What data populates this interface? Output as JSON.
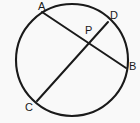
{
  "figure": {
    "background_color": "#f9f9f9",
    "stroke_color": "#1a1a1a",
    "label_color": "#1a1a1a",
    "circle": {
      "name": "circle-outline",
      "center_x": 72,
      "center_y": 60,
      "radius": 56,
      "stroke_width": 2.1,
      "fill": "none"
    },
    "chords": [
      {
        "name": "chord-ab",
        "from": "A",
        "to": "B",
        "x1": 42,
        "y1": 12,
        "x2": 126,
        "y2": 68,
        "stroke_width": 2.0
      },
      {
        "name": "chord-cd",
        "from": "C",
        "to": "D",
        "x1": 37,
        "y1": 101,
        "x2": 108,
        "y2": 22,
        "stroke_width": 2.0
      }
    ],
    "points": [
      {
        "id": "A",
        "label": "A",
        "x": 42,
        "y": 12,
        "label_x": 38,
        "label_y": 1
      },
      {
        "id": "D",
        "label": "D",
        "x": 108,
        "y": 22,
        "label_x": 110,
        "label_y": 10
      },
      {
        "id": "P",
        "label": "P",
        "x": 88,
        "y": 41,
        "label_x": 85,
        "label_y": 25
      },
      {
        "id": "B",
        "label": "B",
        "x": 126,
        "y": 68,
        "label_x": 129,
        "label_y": 61
      },
      {
        "id": "C",
        "label": "C",
        "x": 37,
        "y": 101,
        "label_x": 25,
        "label_y": 102
      }
    ],
    "intersection": {
      "name": "intersection-point-p",
      "label": "P",
      "x": 88,
      "y": 41
    }
  }
}
